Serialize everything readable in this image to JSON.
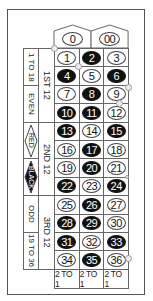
{
  "table": {
    "zeros": [
      {
        "label": "0",
        "color": "green"
      },
      {
        "label": "00",
        "color": "green"
      }
    ],
    "numbers": [
      {
        "n": "1",
        "color": "red"
      },
      {
        "n": "2",
        "color": "black"
      },
      {
        "n": "3",
        "color": "red"
      },
      {
        "n": "4",
        "color": "black"
      },
      {
        "n": "5",
        "color": "red"
      },
      {
        "n": "6",
        "color": "black"
      },
      {
        "n": "7",
        "color": "red"
      },
      {
        "n": "8",
        "color": "black"
      },
      {
        "n": "9",
        "color": "red"
      },
      {
        "n": "10",
        "color": "black"
      },
      {
        "n": "11",
        "color": "black"
      },
      {
        "n": "12",
        "color": "red"
      },
      {
        "n": "13",
        "color": "black"
      },
      {
        "n": "14",
        "color": "red"
      },
      {
        "n": "15",
        "color": "black"
      },
      {
        "n": "16",
        "color": "red"
      },
      {
        "n": "17",
        "color": "black"
      },
      {
        "n": "18",
        "color": "red"
      },
      {
        "n": "19",
        "color": "red"
      },
      {
        "n": "20",
        "color": "black"
      },
      {
        "n": "21",
        "color": "red"
      },
      {
        "n": "22",
        "color": "black"
      },
      {
        "n": "23",
        "color": "red"
      },
      {
        "n": "24",
        "color": "black"
      },
      {
        "n": "25",
        "color": "red"
      },
      {
        "n": "26",
        "color": "black"
      },
      {
        "n": "27",
        "color": "red"
      },
      {
        "n": "28",
        "color": "black"
      },
      {
        "n": "29",
        "color": "black"
      },
      {
        "n": "30",
        "color": "red"
      },
      {
        "n": "31",
        "color": "black"
      },
      {
        "n": "32",
        "color": "red"
      },
      {
        "n": "33",
        "color": "black"
      },
      {
        "n": "34",
        "color": "red"
      },
      {
        "n": "35",
        "color": "black"
      },
      {
        "n": "36",
        "color": "red"
      }
    ],
    "columns": [
      "2 TO 1",
      "2 TO 1",
      "2 TO 1"
    ],
    "dozens": [
      "1ST 12",
      "2ND 12",
      "3RD 12"
    ],
    "outside": [
      {
        "label": "1 TO 18"
      },
      {
        "label": "EVEN"
      },
      {
        "label": "RED",
        "icon": "red-diamond"
      },
      {
        "label": "BLACK",
        "icon": "black-diamond"
      },
      {
        "label": "ODD"
      },
      {
        "label": "19 TO 36"
      }
    ]
  },
  "colors": {
    "black_pocket": "#111111",
    "line": "#666666",
    "background": "#ffffff"
  }
}
